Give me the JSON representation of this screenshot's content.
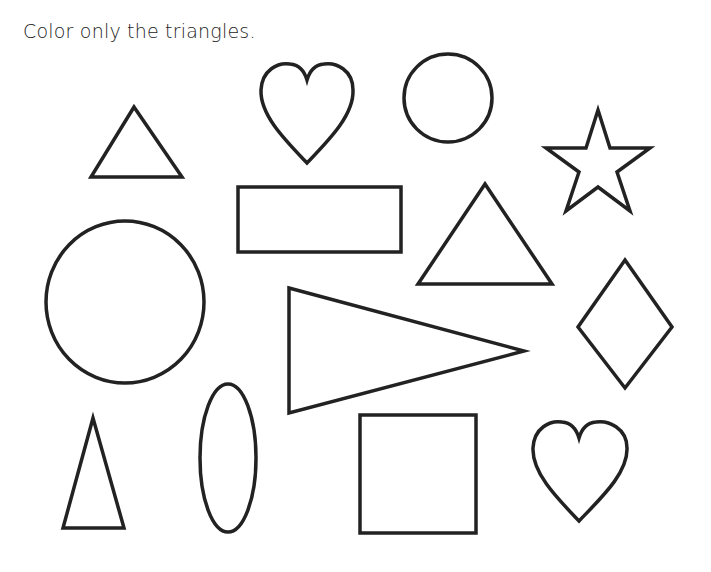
{
  "worksheet": {
    "instruction": "Color only the triangles.",
    "stroke_color": "#222222",
    "background": "#ffffff",
    "shapes": [
      {
        "name": "triangle-1",
        "type": "triangle"
      },
      {
        "name": "heart-1",
        "type": "heart"
      },
      {
        "name": "circle-small",
        "type": "circle"
      },
      {
        "name": "star",
        "type": "star"
      },
      {
        "name": "rectangle",
        "type": "rectangle"
      },
      {
        "name": "triangle-2",
        "type": "triangle"
      },
      {
        "name": "circle-large",
        "type": "circle"
      },
      {
        "name": "triangle-wedge",
        "type": "triangle"
      },
      {
        "name": "diamond",
        "type": "diamond"
      },
      {
        "name": "triangle-tall",
        "type": "triangle"
      },
      {
        "name": "oval",
        "type": "oval"
      },
      {
        "name": "square",
        "type": "square"
      },
      {
        "name": "heart-2",
        "type": "heart"
      }
    ]
  }
}
